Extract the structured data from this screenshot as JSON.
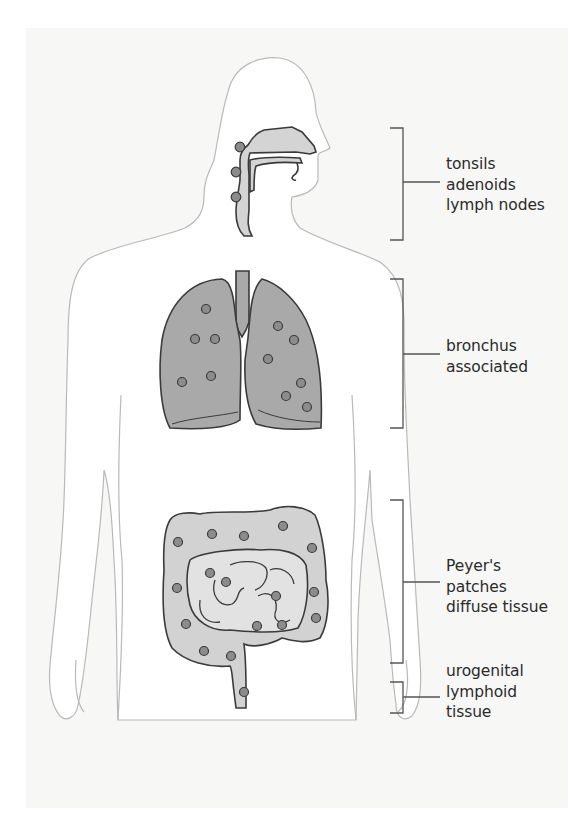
{
  "figure": {
    "background_color": "#f7f7f6",
    "body_outline_color": "#b9b9b9",
    "organ_fill_color": "#a9a9a9",
    "organ_stroke_color": "#3a3a3a",
    "intestine_fill_color": "#d2d2d2",
    "node_fill_color": "#8c8c8c",
    "bracket_color": "#555555",
    "label_color": "#2b2b2b"
  },
  "labels": [
    {
      "id": "upper-respiratory",
      "lines": [
        "tonsils",
        "adenoids",
        "lymph nodes"
      ],
      "bracket": {
        "top": 128,
        "bottom": 240,
        "mid": 182
      }
    },
    {
      "id": "lungs",
      "lines": [
        "bronchus",
        "associated"
      ],
      "bracket": {
        "top": 279,
        "bottom": 428,
        "mid": 354
      }
    },
    {
      "id": "intestine",
      "lines": [
        "Peyer's",
        "patches",
        "diffuse tissue"
      ],
      "bracket": {
        "top": 500,
        "bottom": 663,
        "mid": 582
      }
    },
    {
      "id": "urogenital",
      "lines": [
        "urogenital",
        "lymphoid",
        "tissue"
      ],
      "bracket": {
        "top": 682,
        "bottom": 713,
        "mid": 697
      }
    }
  ],
  "nodes": {
    "head": [
      [
        240,
        147
      ],
      [
        236,
        172
      ],
      [
        236,
        197
      ]
    ],
    "left_lung": [
      [
        206,
        309
      ],
      [
        195,
        339
      ],
      [
        215,
        339
      ],
      [
        182,
        382
      ],
      [
        211,
        376
      ]
    ],
    "right_lung": [
      [
        278,
        326
      ],
      [
        294,
        340
      ],
      [
        268,
        359
      ],
      [
        301,
        383
      ],
      [
        286,
        396
      ],
      [
        307,
        407
      ]
    ],
    "intestine": [
      [
        178,
        542
      ],
      [
        212,
        534
      ],
      [
        244,
        536
      ],
      [
        283,
        526
      ],
      [
        312,
        548
      ],
      [
        177,
        588
      ],
      [
        314,
        592
      ],
      [
        186,
        624
      ],
      [
        316,
        618
      ],
      [
        210,
        573
      ],
      [
        226,
        582
      ],
      [
        276,
        596
      ],
      [
        282,
        625
      ],
      [
        257,
        626
      ],
      [
        204,
        651
      ],
      [
        231,
        656
      ],
      [
        244,
        692
      ]
    ]
  }
}
